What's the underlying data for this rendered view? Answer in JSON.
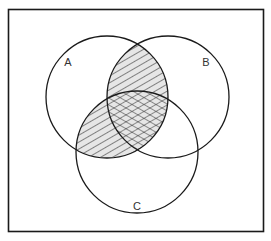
{
  "diagram": {
    "type": "venn",
    "sets": [
      {
        "id": "A",
        "label": "A",
        "cx": 107,
        "cy": 97,
        "r": 61,
        "label_x": 68,
        "label_y": 66
      },
      {
        "id": "B",
        "label": "B",
        "cx": 168,
        "cy": 97,
        "r": 61,
        "label_x": 206,
        "label_y": 66
      },
      {
        "id": "C",
        "label": "C",
        "cx": 137,
        "cy": 152,
        "r": 61,
        "label_x": 137,
        "label_y": 210
      }
    ],
    "shaded_regions": [
      {
        "region": "A∩B only",
        "pattern": "diagonal-hatch"
      },
      {
        "region": "A∩C only",
        "pattern": "diagonal-hatch"
      },
      {
        "region": "A∩B∩C",
        "pattern": "cross-hatch"
      }
    ],
    "colors": {
      "stroke": "#1a1a1a",
      "hatch": "#2a2a2a",
      "hatch_fill": "#e6e6e6",
      "background": "#ffffff"
    }
  }
}
